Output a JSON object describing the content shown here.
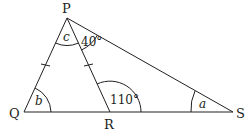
{
  "diagram": {
    "type": "geometry-triangle",
    "colors": {
      "stroke": "#231f20",
      "background": "#ffffff"
    },
    "vertices": {
      "P": {
        "label": "P",
        "x": 67,
        "y": 18
      },
      "Q": {
        "label": "Q",
        "x": 24,
        "y": 112
      },
      "R": {
        "label": "R",
        "x": 110,
        "y": 112
      },
      "S": {
        "label": "S",
        "x": 233,
        "y": 112
      }
    },
    "segments": [
      "PQ",
      "PR",
      "PS",
      "QS"
    ],
    "equal_marks": [
      "PQ",
      "PR"
    ],
    "angles": {
      "c": {
        "label": "c",
        "at": "P",
        "between": [
          "Q",
          "R"
        ]
      },
      "angle_RPS": {
        "label": "40°",
        "at": "P",
        "between": [
          "R",
          "S"
        ]
      },
      "b": {
        "label": "b",
        "at": "Q",
        "between": [
          "P",
          "R"
        ]
      },
      "angle_PRS": {
        "label": "110°",
        "at": "R",
        "between": [
          "P",
          "S"
        ]
      },
      "a": {
        "label": "a",
        "at": "S",
        "between": [
          "P",
          "R"
        ]
      }
    }
  }
}
